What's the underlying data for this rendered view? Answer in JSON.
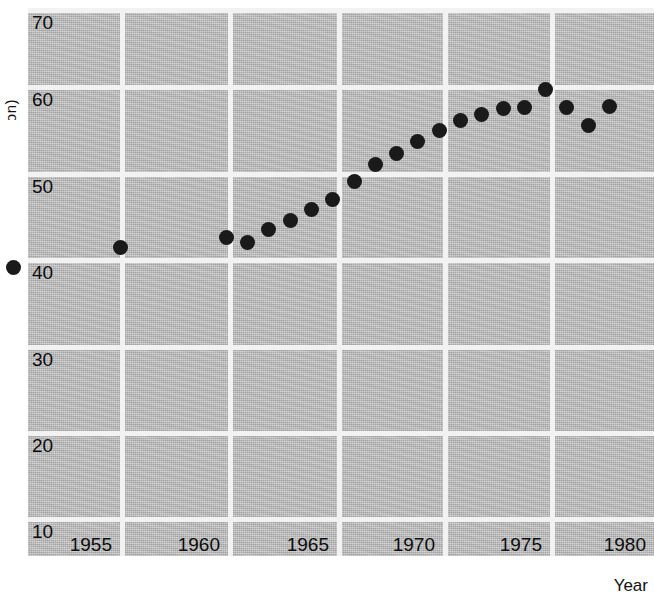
{
  "axes": {
    "x_title": "Year",
    "y_title_clipped": "(million)",
    "y_ticks": [
      70,
      60,
      50,
      40,
      30,
      20,
      10
    ],
    "x_ticks": [
      1955,
      1960,
      1965,
      1970,
      1975,
      1980
    ]
  },
  "style": {
    "plot_background": "#b6b6b6",
    "gridline_color": "#f2f2f2",
    "marker_color": "#1a1a1a",
    "page_background": "#ffffff"
  },
  "chart_data": {
    "type": "scatter",
    "title": "",
    "subtitle": "",
    "xlabel": "Year",
    "ylabel": "(million)",
    "xlim": [
      1950,
      1980
    ],
    "ylim": [
      5,
      72
    ],
    "grid": true,
    "legend": false,
    "legend_position": "none",
    "x_tick_labels": [
      "1955",
      "1960",
      "1965",
      "1970",
      "1975",
      "1980"
    ],
    "y_tick_labels": [
      "10",
      "20",
      "30",
      "40",
      "50",
      "60",
      "70"
    ],
    "x": [
      1950,
      1955,
      1960,
      1961,
      1962,
      1963,
      1964,
      1965,
      1966,
      1967,
      1968,
      1969,
      1970,
      1971,
      1972,
      1973,
      1974,
      1975,
      1976,
      1977,
      1978
    ],
    "values": [
      39.4,
      41.8,
      43.0,
      42.3,
      43.9,
      45.0,
      46.3,
      47.4,
      49.6,
      51.6,
      52.8,
      54.3,
      55.6,
      56.7,
      57.4,
      58.1,
      58.3,
      60.4,
      58.3,
      56.1,
      58.4
    ],
    "series": [
      {
        "name": "series-1",
        "values": [
          39.4,
          41.8,
          43.0,
          42.3,
          43.9,
          45.0,
          46.3,
          47.4,
          49.6,
          51.6,
          52.8,
          54.3,
          55.6,
          56.7,
          57.4,
          58.1,
          58.3,
          60.4,
          58.3,
          56.1,
          58.4
        ]
      }
    ],
    "annotations": []
  },
  "layout": {
    "plot_left_px": 28,
    "plot_top_px": 8,
    "plot_width_px": 626,
    "plot_height_px": 548,
    "y_gridlines_px": {
      "70": 0,
      "60": 77,
      "50": 164,
      "40": 250,
      "30": 337,
      "20": 423,
      "10": 509
    },
    "x_gridlines_px": {
      "1955": 92,
      "1960": 200,
      "1965": 309,
      "1970": 415,
      "1975": 522,
      "1980": 624
    }
  }
}
